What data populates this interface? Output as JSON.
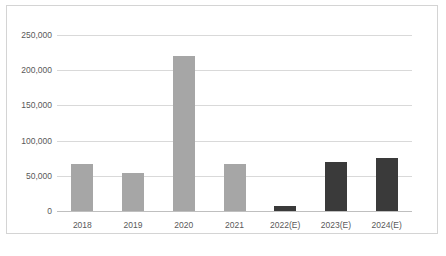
{
  "chart_data": {
    "type": "bar",
    "title": "",
    "subtitle": "",
    "xlabel": "",
    "ylabel": "",
    "categories": [
      "2018",
      "2019",
      "2020",
      "2021",
      "2022(E)",
      "2023(E)",
      "2024(E)"
    ],
    "values": [
      67000,
      54000,
      220000,
      67000,
      6500,
      70000,
      75000
    ],
    "series": [
      {
        "name": "",
        "values": [
          67000,
          54000,
          220000,
          67000,
          6500,
          70000,
          75000
        ]
      }
    ],
    "bar_colors": [
      "#a6a6a6",
      "#a6a6a6",
      "#a6a6a6",
      "#a6a6a6",
      "#3a3a3a",
      "#3a3a3a",
      "#3a3a3a"
    ],
    "ylim": [
      0,
      250000
    ],
    "yticks": [
      0,
      50000,
      100000,
      150000,
      200000,
      250000
    ],
    "ytick_labels": [
      "0",
      "50,000",
      "100,000",
      "150,000",
      "200,000",
      "250,000"
    ],
    "grid": true,
    "legend": false,
    "legend_position": "none",
    "annotations": []
  },
  "colors": {
    "actual_bar": "#a6a6a6",
    "estimate_bar": "#3a3a3a",
    "gridline": "#d9d9d9",
    "axis_line": "#bfbfbf",
    "tick_text": "#595959",
    "border": "#d4d4d4",
    "background": "#ffffff"
  }
}
